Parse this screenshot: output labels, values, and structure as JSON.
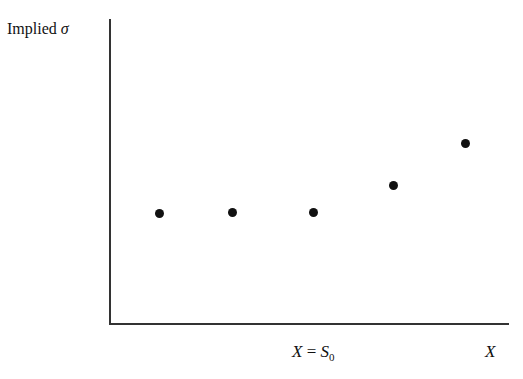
{
  "chart_data": {
    "type": "scatter",
    "title": "",
    "ylabel": "Implied σ",
    "ylabel_text": "Implied",
    "ylabel_symbol": "σ",
    "xlabel": "X",
    "annotations": [
      {
        "text": "X = S0",
        "position": "x-axis, near center-right"
      }
    ],
    "x_tick_labels": [
      "X = S0",
      "X"
    ],
    "grid": false,
    "legend": null,
    "points_pixel": [
      [
        159,
        213
      ],
      [
        232,
        212
      ],
      [
        313,
        212
      ],
      [
        393,
        185
      ],
      [
        465,
        143
      ]
    ],
    "x": [
      1,
      2,
      3,
      4,
      5
    ],
    "y": [
      0.3,
      0.3,
      0.3,
      0.42,
      0.6
    ],
    "note": "Values are qualitative; flat implied volatility for low strikes up to X=S0, then rising for higher strikes."
  },
  "labels": {
    "y_text": "Implied ",
    "y_sym": "σ",
    "x_center_a": "X",
    "x_center_eq": " = ",
    "x_center_s": "S",
    "x_center_sub": "0",
    "x_right": "X"
  }
}
